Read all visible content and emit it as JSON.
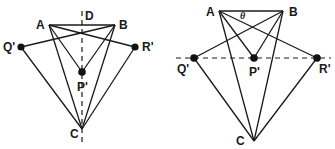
{
  "figure": {
    "left_diagram": {
      "labels": {
        "A": "A",
        "B": "B",
        "C": "C",
        "D": "D",
        "P": "P'",
        "Q": "Q'",
        "R": "R'"
      },
      "points": {
        "A": [
          49,
          25
        ],
        "B": [
          115,
          25
        ],
        "C": [
          82,
          129
        ],
        "P": [
          82,
          72
        ],
        "Q": [
          21,
          47
        ],
        "R": [
          135,
          47
        ]
      },
      "dashed_axis": "vertical"
    },
    "right_diagram": {
      "labels": {
        "A": "A",
        "B": "B",
        "C": "C",
        "theta": "θ",
        "P": "P'",
        "Q": "Q'",
        "R": "R'"
      },
      "points": {
        "A": [
          219,
          11
        ],
        "B": [
          283,
          11
        ],
        "C": [
          254,
          141
        ],
        "P": [
          254,
          58
        ],
        "Q": [
          194,
          58
        ],
        "R": [
          317,
          58
        ]
      },
      "dashed_axis": "horizontal"
    },
    "colors": {
      "line": "#1a1a1a",
      "background": "#ffffff"
    }
  }
}
